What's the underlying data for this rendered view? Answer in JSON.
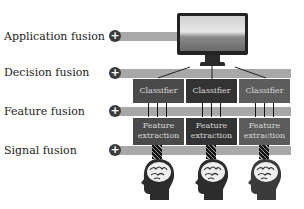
{
  "diagram": {
    "levels": [
      {
        "label": "Application fusion",
        "icon": "plus-icon"
      },
      {
        "label": "Decision fusion",
        "icon": "plus-icon"
      },
      {
        "label": "Feature fusion",
        "icon": "plus-icon"
      },
      {
        "label": "Signal fusion",
        "icon": "plus-icon"
      }
    ],
    "plus_glyph": "+",
    "columns": [
      {
        "classifier": "Classifier",
        "feature_line1": "Feature",
        "feature_line2": "extraction"
      },
      {
        "classifier": "Classifier",
        "feature_line1": "Feature",
        "feature_line2": "extraction"
      },
      {
        "classifier": "Classifier",
        "feature_line1": "Feature",
        "feature_line2": "extraction"
      }
    ],
    "output_device": "monitor",
    "sources": [
      "head-brain",
      "head-brain",
      "head-brain"
    ],
    "colors": {
      "bar": "#a8a8a8",
      "box_dark": "#333333",
      "box": "#4a4a4a",
      "box_light": "#5c5c5c",
      "plus": "#3a3a3a"
    }
  }
}
